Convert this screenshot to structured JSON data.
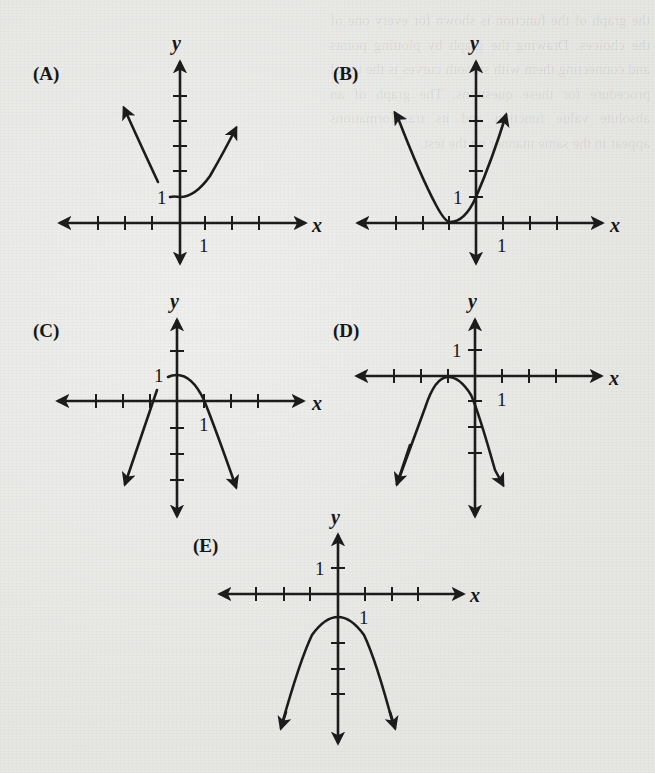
{
  "figure": {
    "panels": [
      {
        "id": "A",
        "label": "(A)",
        "x_name": "x",
        "y_name": "y",
        "x_tick_label": "1",
        "y_tick_label": "1",
        "description": "Upward parabola, vertex (0,1); left branch drawn only for x < -0.5 (gap near vertex)"
      },
      {
        "id": "B",
        "label": "(B)",
        "x_name": "x",
        "y_name": "y",
        "x_tick_label": "1",
        "y_tick_label": "1",
        "description": "Upward parabola, vertex (-1,0), passes through (0,1)"
      },
      {
        "id": "C",
        "label": "(C)",
        "x_name": "x",
        "y_name": "y",
        "x_tick_label": "1",
        "y_tick_label": "1",
        "description": "Downward parabola, vertex (0,1), crosses x-axis at 1; left branch drawn separately as line through (-1,0)"
      },
      {
        "id": "D",
        "label": "(D)",
        "x_name": "x",
        "y_name": "y",
        "x_tick_label": "1",
        "y_tick_label": "1",
        "description": "Downward parabola, vertex (-1,0), passes through (0,-1)"
      },
      {
        "id": "E",
        "label": "(E)",
        "x_name": "x",
        "y_name": "y",
        "x_tick_label": "1",
        "y_tick_label": "1",
        "description": "Downward parabola, vertex (0,-1)"
      }
    ]
  },
  "bleed_through_text": "the graph of the function is shown for every one of the choices. Drawing the graph by plotting points and connecting them with smooth curves is the usual procedure for these questions. The graph of an absolute value function and its transformations appear in the same manner on the test."
}
